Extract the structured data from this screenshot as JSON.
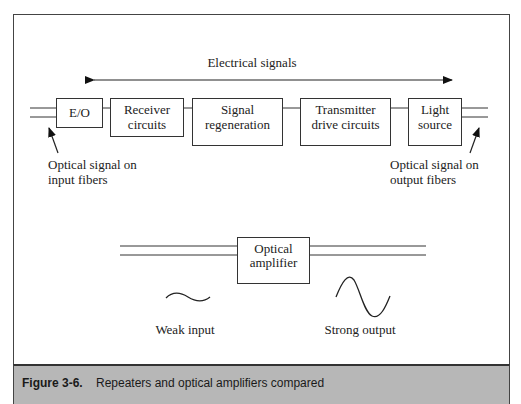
{
  "figure": {
    "label": "Figure 3-6.",
    "caption": "Repeaters and optical amplifiers compared",
    "caption_bar_color": "#b7b7b7"
  },
  "repeater": {
    "bus_label": "Electrical signals",
    "blocks": [
      {
        "id": "eo",
        "lines": [
          "E/O"
        ]
      },
      {
        "id": "receiver",
        "lines": [
          "Receiver",
          "circuits"
        ]
      },
      {
        "id": "regeneration",
        "lines": [
          "Signal",
          "regeneration"
        ]
      },
      {
        "id": "transmitter",
        "lines": [
          "Transmitter",
          "drive circuits"
        ]
      },
      {
        "id": "light-source",
        "lines": [
          "Light",
          "source"
        ]
      }
    ],
    "input_note": [
      "Optical signal on",
      "input fibers"
    ],
    "output_note": [
      "Optical signal on",
      "output fibers"
    ]
  },
  "amplifier": {
    "block_lines": [
      "Optical",
      "amplifier"
    ],
    "weak_label": "Weak input",
    "strong_label": "Strong output"
  }
}
